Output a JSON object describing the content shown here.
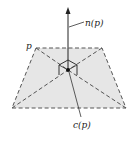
{
  "diagram": {
    "labels": {
      "normal": "n(p)",
      "polygon": "p",
      "centroid": "c(p)"
    },
    "colors": {
      "fill": "#e6e6e6",
      "stroke": "#444444",
      "arrow": "#222222"
    }
  }
}
